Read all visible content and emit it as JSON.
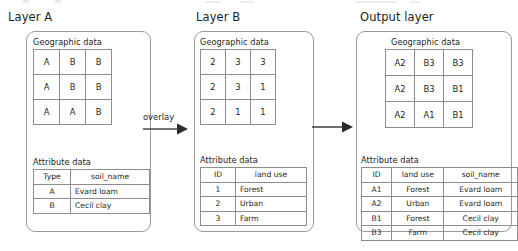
{
  "diagram": {
    "arrows": [
      {
        "name": "overlay-arrow",
        "label": "overlay"
      },
      {
        "name": "result-arrow",
        "label": ""
      }
    ]
  },
  "layer_a": {
    "title": "Layer A",
    "geographic_label": "Geographic data",
    "attribute_label": "Attribute data",
    "grid": [
      [
        "A",
        "B",
        "B"
      ],
      [
        "A",
        "B",
        "B"
      ],
      [
        "A",
        "A",
        "B"
      ]
    ],
    "attribute_headers": [
      "Type",
      "soil_name"
    ],
    "attribute_rows": [
      [
        "A",
        "Evard loam"
      ],
      [
        "B",
        "Cecil clay"
      ]
    ]
  },
  "layer_b": {
    "title": "Layer B",
    "geographic_label": "Geographic data",
    "attribute_label": "Attribute data",
    "grid": [
      [
        "2",
        "3",
        "3"
      ],
      [
        "2",
        "3",
        "1"
      ],
      [
        "2",
        "1",
        "1"
      ]
    ],
    "attribute_headers": [
      "ID",
      "land use"
    ],
    "attribute_rows": [
      [
        "1",
        "Forest"
      ],
      [
        "2",
        "Urban"
      ],
      [
        "3",
        "Farm"
      ]
    ]
  },
  "output_layer": {
    "title": "Output layer",
    "geographic_label": "Geographic data",
    "attribute_label": "Attribute data",
    "grid": [
      [
        "A2",
        "B3",
        "B3"
      ],
      [
        "A2",
        "B3",
        "B1"
      ],
      [
        "A2",
        "A1",
        "B1"
      ]
    ],
    "attribute_headers": [
      "ID",
      "land use",
      "soil_name"
    ],
    "attribute_rows": [
      [
        "A1",
        "Forest",
        "Evard loam"
      ],
      [
        "A2",
        "Urban",
        "Evard loam"
      ],
      [
        "B1",
        "Forest",
        "Cecil clay"
      ],
      [
        "B3",
        "Farm",
        "Cecil clay"
      ]
    ]
  },
  "colors": {
    "border": "#9a9a9a",
    "cell_border": "#8d8d8d",
    "text": "#231f20",
    "background": "#ffffff"
  }
}
